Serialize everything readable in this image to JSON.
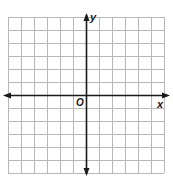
{
  "diagram": {
    "type": "coordinate-plane",
    "grid": {
      "columns": 12,
      "rows": 12,
      "cell_size_px": 13,
      "left": 8,
      "top": 17,
      "line_color": "#b8b8b8"
    },
    "origin": {
      "px_x": 86,
      "px_y": 95,
      "label": "O"
    },
    "axes": {
      "x_label": "x",
      "y_label": "y",
      "color": "#1a1a1a",
      "x_range_units": [
        -6,
        6
      ],
      "y_range_units": [
        -6,
        6
      ],
      "arrows": "both-ends"
    }
  }
}
